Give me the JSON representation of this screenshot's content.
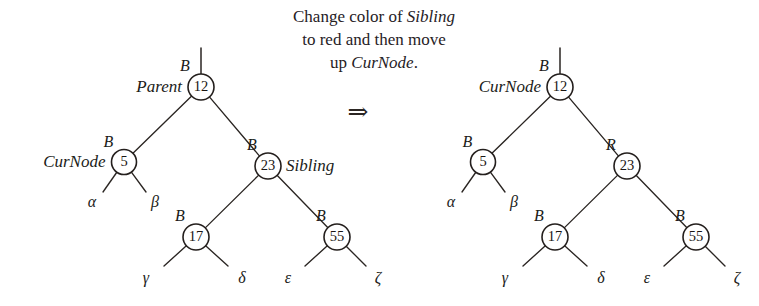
{
  "figure": {
    "caption": {
      "line1_pre": "Change color of ",
      "line1_em": "Sibling",
      "line2": "to red and then move",
      "line3_pre": "up ",
      "line3_em": "CurNode",
      "line3_post": "."
    },
    "arrow": "⇒",
    "left_tree": {
      "label": "before",
      "nodes": [
        {
          "id": "n12",
          "key": "12",
          "color_label": "B",
          "name_label": "Parent",
          "name_side": "left",
          "cx": 201,
          "cy": 87,
          "r": 13
        },
        {
          "id": "n5",
          "key": "5",
          "color_label": "B",
          "name_label": "CurNode",
          "name_side": "left",
          "cx": 124,
          "cy": 162,
          "r": 12.5
        },
        {
          "id": "n23",
          "key": "23",
          "color_label": "B",
          "name_label": "Sibling",
          "name_side": "right",
          "cx": 268,
          "cy": 166,
          "r": 13
        },
        {
          "id": "n17",
          "key": "17",
          "color_label": "B",
          "name_label": "",
          "name_side": "none",
          "cx": 196,
          "cy": 237,
          "r": 13
        },
        {
          "id": "n55",
          "key": "55",
          "color_label": "B",
          "name_label": "",
          "name_side": "none",
          "cx": 337,
          "cy": 237,
          "r": 13
        }
      ],
      "leaves": [
        {
          "label": "α",
          "x": 92,
          "y": 207,
          "from": "n5",
          "tip_x": 103,
          "tip_y": 192
        },
        {
          "label": "β",
          "x": 155,
          "y": 207,
          "from": "n5",
          "tip_x": 146,
          "tip_y": 192
        },
        {
          "label": "γ",
          "x": 146,
          "y": 283,
          "from": "n17",
          "tip_x": 164,
          "tip_y": 266
        },
        {
          "label": "δ",
          "x": 242,
          "y": 283,
          "from": "n17",
          "tip_x": 228,
          "tip_y": 266
        },
        {
          "label": "ε",
          "x": 288,
          "y": 283,
          "from": "n55",
          "tip_x": 305,
          "tip_y": 266
        },
        {
          "label": "ζ",
          "x": 378,
          "y": 283,
          "from": "n55",
          "tip_x": 366,
          "tip_y": 266
        }
      ],
      "edges": [
        {
          "from": "n12",
          "to": "n5"
        },
        {
          "from": "n12",
          "to": "n23"
        },
        {
          "from": "n23",
          "to": "n17"
        },
        {
          "from": "n23",
          "to": "n55"
        }
      ],
      "root_stub": {
        "x": 201,
        "y_top": 48,
        "y_bottom": 74
      }
    },
    "right_tree": {
      "label": "after",
      "nodes": [
        {
          "id": "n12",
          "key": "12",
          "color_label": "B",
          "name_label": "CurNode",
          "name_side": "left",
          "cx": 560,
          "cy": 87,
          "r": 13
        },
        {
          "id": "n5",
          "key": "5",
          "color_label": "B",
          "name_label": "",
          "name_side": "none",
          "cx": 483,
          "cy": 162,
          "r": 12.5
        },
        {
          "id": "n23",
          "key": "23",
          "color_label": "R",
          "name_label": "",
          "name_side": "none",
          "cx": 627,
          "cy": 166,
          "r": 13
        },
        {
          "id": "n17",
          "key": "17",
          "color_label": "B",
          "name_label": "",
          "name_side": "none",
          "cx": 555,
          "cy": 237,
          "r": 13
        },
        {
          "id": "n55",
          "key": "55",
          "color_label": "B",
          "name_label": "",
          "name_side": "none",
          "cx": 696,
          "cy": 237,
          "r": 13
        }
      ],
      "leaves": [
        {
          "label": "α",
          "x": 451,
          "y": 207,
          "from": "n5",
          "tip_x": 462,
          "tip_y": 192
        },
        {
          "label": "β",
          "x": 514,
          "y": 207,
          "from": "n5",
          "tip_x": 505,
          "tip_y": 192
        },
        {
          "label": "γ",
          "x": 505,
          "y": 283,
          "from": "n17",
          "tip_x": 523,
          "tip_y": 266
        },
        {
          "label": "δ",
          "x": 601,
          "y": 283,
          "from": "n17",
          "tip_x": 587,
          "tip_y": 266
        },
        {
          "label": "ε",
          "x": 647,
          "y": 283,
          "from": "n55",
          "tip_x": 664,
          "tip_y": 266
        },
        {
          "label": "ζ",
          "x": 737,
          "y": 283,
          "from": "n55",
          "tip_x": 725,
          "tip_y": 266
        }
      ],
      "edges": [
        {
          "from": "n12",
          "to": "n5"
        },
        {
          "from": "n12",
          "to": "n23"
        },
        {
          "from": "n23",
          "to": "n17"
        },
        {
          "from": "n23",
          "to": "n55"
        }
      ],
      "root_stub": {
        "x": 560,
        "y_top": 48,
        "y_bottom": 74
      }
    },
    "caption_layout": {
      "line1_x": 374,
      "line1_y": 22,
      "line2_x": 374,
      "line2_y": 45,
      "line3_x": 374,
      "line3_y": 68,
      "arrow_x": 358,
      "arrow_y": 120
    },
    "colors": {
      "ink": "#241f1d",
      "paper": "#ffffff",
      "text": "#26211f"
    }
  }
}
